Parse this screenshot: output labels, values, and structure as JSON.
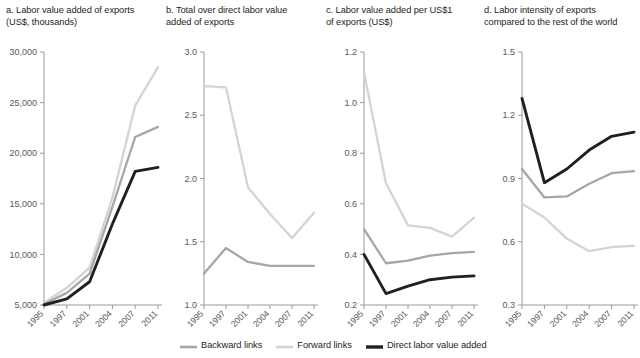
{
  "figure": {
    "legend": {
      "position": "bottom",
      "items": [
        {
          "label": "Backward links",
          "color": "#a6a6a6",
          "width": 2.6
        },
        {
          "label": "Forward links",
          "color": "#d4d4d4",
          "width": 2.6
        },
        {
          "label": "Direct labor value added",
          "color": "#231f20",
          "width": 3.4
        }
      ]
    },
    "years": [
      "1995",
      "1997",
      "2001",
      "2004",
      "2007",
      "2011"
    ]
  },
  "chart_data": [
    {
      "type": "line",
      "panel": "a",
      "title": "a. Labor value added of exports\n(US$, thousands)",
      "xlabel": "",
      "ylabel": "",
      "x": [
        1995,
        1997,
        2001,
        2004,
        2007,
        2011
      ],
      "xtick_labels": [
        "1995",
        "1997",
        "2001",
        "2004",
        "2007",
        "2011"
      ],
      "ylim": [
        5000,
        30000
      ],
      "yticks": [
        5000,
        10000,
        15000,
        20000,
        25000,
        30000
      ],
      "ytick_labels": [
        "5,000",
        "10,000",
        "15,000",
        "20,000",
        "25,000",
        "30,000"
      ],
      "grid": false,
      "series": [
        {
          "name": "Backward links",
          "color": "#a6a6a6",
          "values": [
            5100,
            6200,
            8100,
            14700,
            21600,
            22600
          ]
        },
        {
          "name": "Forward links",
          "color": "#d4d4d4",
          "values": [
            5200,
            6700,
            8700,
            15600,
            24700,
            28500
          ]
        },
        {
          "name": "Direct labor value added",
          "color": "#231f20",
          "values": [
            5000,
            5600,
            7300,
            13000,
            18200,
            18600
          ]
        }
      ]
    },
    {
      "type": "line",
      "panel": "b",
      "title": "b. Total over direct labor value\nadded of exports",
      "xlabel": "",
      "ylabel": "",
      "x": [
        1995,
        1997,
        2001,
        2004,
        2007,
        2011
      ],
      "xtick_labels": [
        "1995",
        "1997",
        "2001",
        "2004",
        "2007",
        "2011"
      ],
      "ylim": [
        1.0,
        3.0
      ],
      "yticks": [
        1.0,
        1.5,
        2.0,
        2.5,
        3.0
      ],
      "ytick_labels": [
        "1.0",
        "1.5",
        "2.0",
        "2.5",
        "3.0"
      ],
      "grid": false,
      "series": [
        {
          "name": "Backward links",
          "color": "#a6a6a6",
          "values": [
            1.25,
            1.45,
            1.34,
            1.31,
            1.31,
            1.31
          ]
        },
        {
          "name": "Forward links",
          "color": "#d4d4d4",
          "values": [
            2.73,
            2.72,
            1.93,
            1.72,
            1.53,
            1.73
          ]
        },
        {
          "name": "Direct labor value added",
          "color": "#231f20",
          "values": [
            null,
            null,
            null,
            null,
            null,
            null
          ]
        }
      ]
    },
    {
      "type": "line",
      "panel": "c",
      "title": "c. Labor value added per US$1\nof exports (US$)",
      "xlabel": "",
      "ylabel": "",
      "x": [
        1995,
        1997,
        2001,
        2004,
        2007,
        2011
      ],
      "xtick_labels": [
        "1995",
        "1997",
        "2001",
        "2004",
        "2007",
        "2011"
      ],
      "ylim": [
        0.2,
        1.2
      ],
      "yticks": [
        0.2,
        0.4,
        0.6,
        0.8,
        1.0,
        1.2
      ],
      "ytick_labels": [
        "0.2",
        "0.4",
        "0.6",
        "0.8",
        "1.0",
        "1.2"
      ],
      "grid": false,
      "series": [
        {
          "name": "Backward links",
          "color": "#a6a6a6",
          "values": [
            0.5,
            0.365,
            0.375,
            0.395,
            0.405,
            0.41
          ]
        },
        {
          "name": "Forward links",
          "color": "#d4d4d4",
          "values": [
            1.12,
            0.68,
            0.515,
            0.505,
            0.47,
            0.545
          ]
        },
        {
          "name": "Direct labor value added",
          "color": "#231f20",
          "values": [
            0.4,
            0.245,
            0.275,
            0.3,
            0.31,
            0.315
          ]
        }
      ]
    },
    {
      "type": "line",
      "panel": "d",
      "title": "d. Labor intensity of exports\ncompared to the rest of the world",
      "xlabel": "",
      "ylabel": "",
      "x": [
        1995,
        1997,
        2001,
        2004,
        2007,
        2011
      ],
      "xtick_labels": [
        "1995",
        "1997",
        "2001",
        "2004",
        "2007",
        "2011"
      ],
      "ylim": [
        0.3,
        1.5
      ],
      "yticks": [
        0.3,
        0.6,
        0.9,
        1.2,
        1.5
      ],
      "ytick_labels": [
        "0.3",
        "0.6",
        "0.9",
        "1.2",
        "1.5"
      ],
      "grid": false,
      "series": [
        {
          "name": "Backward links",
          "color": "#a6a6a6",
          "values": [
            0.945,
            0.81,
            0.815,
            0.875,
            0.925,
            0.935
          ]
        },
        {
          "name": "Forward links",
          "color": "#d4d4d4",
          "values": [
            0.78,
            0.715,
            0.615,
            0.555,
            0.575,
            0.58
          ]
        },
        {
          "name": "Direct labor value added",
          "color": "#231f20",
          "values": [
            1.28,
            0.88,
            0.945,
            1.035,
            1.1,
            1.12
          ]
        }
      ]
    }
  ]
}
